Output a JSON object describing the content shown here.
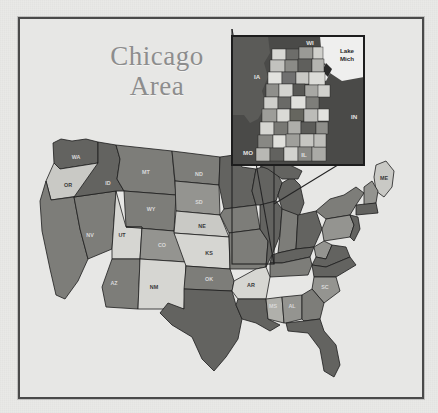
{
  "page": {
    "background_color": "#e9e9e7",
    "frame_color": "#4a4a4a"
  },
  "title": {
    "text": "Chicago\nArea",
    "line1": "Chicago",
    "line2": "Area",
    "color": "#8d8d8d"
  },
  "inset": {
    "name": "chicago-area-county-inset",
    "labels": [
      {
        "text": "IA",
        "x": 25,
        "y": 28,
        "tone": "light"
      },
      {
        "text": "WI",
        "x": 78,
        "y": 9,
        "tone": "light"
      },
      {
        "text": "Lake\nMich",
        "x": 117,
        "y": 16,
        "tone": "dark"
      },
      {
        "text": "IN",
        "x": 126,
        "y": 85,
        "tone": "light"
      },
      {
        "text": "MO",
        "x": 30,
        "y": 118,
        "tone": "light"
      },
      {
        "text": "IL",
        "x": 74,
        "y": 120,
        "tone": "light"
      }
    ],
    "border_color": "#1d1d1d",
    "water_color": "#efefee"
  },
  "map": {
    "name": "united-states-choropleth",
    "land_stroke": "#1d1d1d",
    "shades": {
      "very_light": "#e4e4e1",
      "light": "#c9c9c5",
      "medium_light": "#b0b0ab",
      "medium": "#949490",
      "medium_dark": "#7d7d79",
      "dark": "#636360",
      "very_dark": "#4f4f4d"
    },
    "state_labels": [
      {
        "code": "WA",
        "x": 56,
        "y": 140,
        "tone": "dk"
      },
      {
        "code": "OR",
        "x": 48,
        "y": 168,
        "tone": "lt"
      },
      {
        "code": "ID",
        "x": 88,
        "y": 166,
        "tone": "dk"
      },
      {
        "code": "MT",
        "x": 126,
        "y": 155,
        "tone": "dk"
      },
      {
        "code": "ND",
        "x": 179,
        "y": 157,
        "tone": "dk"
      },
      {
        "code": "SD",
        "x": 179,
        "y": 185,
        "tone": "dk"
      },
      {
        "code": "NE",
        "x": 182,
        "y": 209,
        "tone": "lt"
      },
      {
        "code": "WY",
        "x": 131,
        "y": 192,
        "tone": "dk"
      },
      {
        "code": "NV",
        "x": 70,
        "y": 218,
        "tone": "dk"
      },
      {
        "code": "UT",
        "x": 102,
        "y": 218,
        "tone": "lt"
      },
      {
        "code": "CO",
        "x": 142,
        "y": 228,
        "tone": "dk"
      },
      {
        "code": "KS",
        "x": 189,
        "y": 236,
        "tone": "lt"
      },
      {
        "code": "AZ",
        "x": 94,
        "y": 266,
        "tone": "dk"
      },
      {
        "code": "NM",
        "x": 134,
        "y": 270,
        "tone": "lt"
      },
      {
        "code": "OK",
        "x": 189,
        "y": 262,
        "tone": "dk"
      },
      {
        "code": "AR",
        "x": 231,
        "y": 268,
        "tone": "lt"
      },
      {
        "code": "MS",
        "x": 248,
        "y": 285,
        "tone": "dk"
      },
      {
        "code": "AL",
        "x": 272,
        "y": 285,
        "tone": "dk"
      },
      {
        "code": "SC",
        "x": 308,
        "y": 272,
        "tone": "dk"
      },
      {
        "code": "ME",
        "x": 365,
        "y": 163,
        "tone": "lt"
      }
    ]
  }
}
